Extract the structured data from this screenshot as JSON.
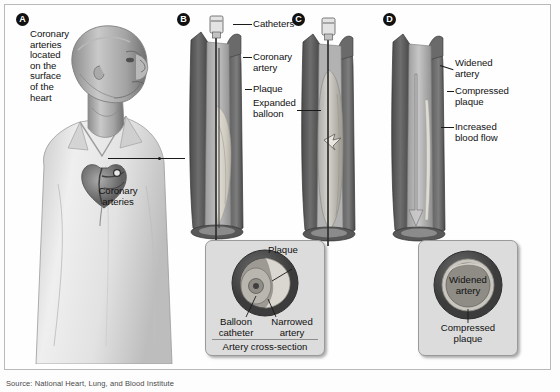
{
  "figure": {
    "source": "Source: National Heart, Lung, and Blood Institute",
    "style": "grayscale medical illustration"
  },
  "panels": [
    {
      "id": "A",
      "badge": "A",
      "name": "patient-anatomy",
      "labels": [
        {
          "name": "coronary-arteries-location",
          "text": "Coronary\narteries\nlocated\non the\nsurface\nof the\nheart"
        },
        {
          "name": "coronary-arteries-callout",
          "text": "Coronary\narteries"
        }
      ]
    },
    {
      "id": "B",
      "badge": "B",
      "name": "catheter-inserted",
      "labels": [
        {
          "name": "catheters",
          "text": "Catheters"
        },
        {
          "name": "coronary-artery",
          "text": "Coronary\nartery"
        },
        {
          "name": "plaque",
          "text": "Plaque"
        },
        {
          "name": "expanded-balloon",
          "text": "Expanded\nballoon"
        }
      ]
    },
    {
      "id": "C",
      "badge": "C",
      "name": "balloon-inflated",
      "labels": []
    },
    {
      "id": "D",
      "badge": "D",
      "name": "artery-widened",
      "labels": [
        {
          "name": "widened-artery",
          "text": "Widened\nartery"
        },
        {
          "name": "compressed-plaque",
          "text": "Compressed\nplaque"
        },
        {
          "name": "increased-blood-flow",
          "text": "Increased\nblood flow"
        }
      ]
    }
  ],
  "insets": {
    "left": {
      "name": "artery-cross-section-before",
      "title": "Artery cross-section",
      "plaque_label": "Plaque",
      "balloon_label": "Balloon\ncatheter",
      "narrowed_label": "Narrowed\nartery"
    },
    "right": {
      "name": "artery-cross-section-after",
      "widened_label": "Widened\nartery",
      "compressed_label": "Compressed\nplaque"
    }
  },
  "colors": {
    "outer_wall": "#5d5d5d",
    "inner_wall": "#8e8e8e",
    "lumen": "#b4b4b4",
    "plaque": "#d8d6cf",
    "catheter": "#3a3a3a",
    "inset_bg": "#dcdcdc",
    "badge_bg": "#111111",
    "text": "#111111"
  }
}
